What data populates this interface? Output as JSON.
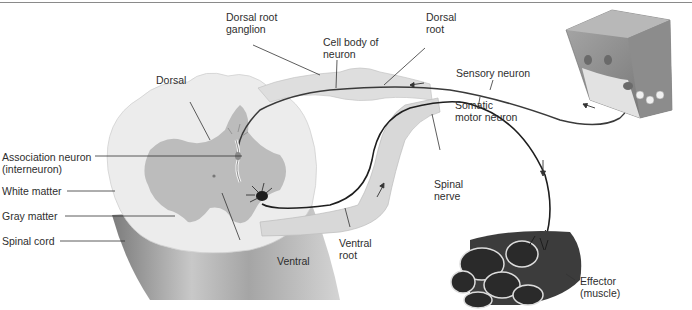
{
  "diagram": {
    "labels": {
      "dorsal_root_ganglion": [
        "Dorsal root",
        "ganglion"
      ],
      "cell_body": [
        "Cell body of",
        "neuron"
      ],
      "dorsal_root": [
        "Dorsal",
        "root"
      ],
      "sensory_neuron": "Sensory neuron",
      "somatic_motor_neuron": [
        "Somatic",
        "motor neuron"
      ],
      "dorsal": "Dorsal",
      "association_neuron": [
        "Association neuron",
        "(interneuron)"
      ],
      "white_matter": "White matter",
      "gray_matter": "Gray matter",
      "spinal_cord": "Spinal cord",
      "spinal_nerve": [
        "Spinal",
        "nerve"
      ],
      "ventral_root": [
        "Ventral",
        "root"
      ],
      "ventral": "Ventral",
      "effector": [
        "Effector",
        "(muscle)"
      ]
    },
    "colors": {
      "white_matter": "#ebebeb",
      "gray_matter": "#b9b9b9",
      "cord_shade": "#9a9a9a",
      "nerve_fill": "#d9d9d9",
      "neuron_line": "#3a3a3a",
      "muscle": "#3c3c3c",
      "skin": "#8f8f8f"
    }
  }
}
